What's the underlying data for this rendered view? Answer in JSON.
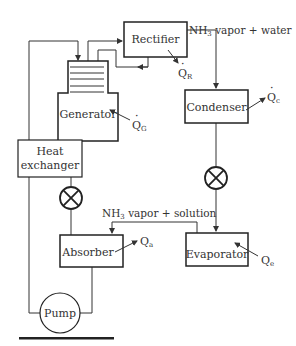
{
  "diagram": {
    "type": "absorption refrigeration cycle",
    "components": {
      "rectifier": "Rectifier",
      "generator": "Generator",
      "condenser": "Condenser",
      "heat_exchanger_line1": "Heat",
      "heat_exchanger_line2": "exchanger",
      "absorber": "Absorber",
      "evaporator": "Evaporator",
      "pump": "Pump"
    },
    "flow_labels": {
      "top_flow_prefix": "NH",
      "top_flow_sub": "3",
      "top_flow_rest": " vapor + water",
      "mid_flow_prefix": "NH",
      "mid_flow_sub": "3",
      "mid_flow_rest": " vapor + solution"
    },
    "heat_labels": {
      "rectifier_q": "Q",
      "rectifier_q_sub": "R",
      "generator_q": "Q",
      "generator_q_sub": "G",
      "condenser_q": "Q",
      "condenser_q_sub": "c",
      "absorber_q": "Q",
      "absorber_q_sub": "a",
      "evaporator_q": "Q",
      "evaporator_q_sub": "e"
    },
    "colors": {
      "line": "#333333",
      "background": "#ffffff"
    }
  }
}
